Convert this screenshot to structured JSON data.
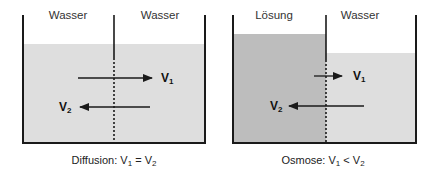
{
  "colors": {
    "water": "#dedede",
    "solution": "#bdbdbd",
    "lines": "#1a1a1a",
    "background": "#ffffff"
  },
  "panels": [
    {
      "id": "diffusion",
      "left_label": "Wasser",
      "right_label": "Wasser",
      "left_fluid": "water",
      "right_fluid": "water",
      "v1_label": "V",
      "v1_sub": "1",
      "v2_label": "V",
      "v2_sub": "2",
      "v1_relative_magnitude": "equal",
      "v2_relative_magnitude": "equal",
      "caption_prefix": "Diffusion: V",
      "caption_sub1": "1",
      "caption_mid": " = V",
      "caption_sub2": "2"
    },
    {
      "id": "osmosis",
      "left_label": "Lösung",
      "right_label": "Wasser",
      "left_fluid": "solution",
      "right_fluid": "water",
      "v1_label": "V",
      "v1_sub": "1",
      "v2_label": "V",
      "v2_sub": "2",
      "v1_relative_magnitude": "small",
      "v2_relative_magnitude": "large",
      "caption_prefix": "Osmose: V",
      "caption_sub1": "1",
      "caption_mid": " < V",
      "caption_sub2": "2"
    }
  ]
}
